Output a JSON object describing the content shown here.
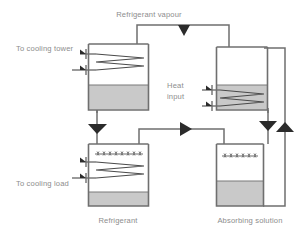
{
  "diagram": {
    "type": "schematic",
    "canvas": {
      "width": 303,
      "height": 238
    },
    "colors": {
      "background": "#ffffff",
      "outline": "#6f6f6f",
      "liquid": "#c9c9c9",
      "coil": "#4a4a4a",
      "arrow": "#2b2b2b",
      "label_text": "#8d8d8d"
    },
    "labels": {
      "refrigerant_vapour": "Refrigerant vapour",
      "to_cooling_tower": "To cooling tower",
      "heat_input_line1": "Heat",
      "heat_input_line2": "input",
      "to_cooling_load": "To cooling load",
      "refrigerant": "Refrigerant",
      "absorbing_solution": "Absorbing solution"
    },
    "vessels": [
      {
        "id": "condenser",
        "name": "condenser-vessel",
        "position": "top-left",
        "has_coil": true,
        "coil_in_liquid": false,
        "has_spray": false,
        "liquid_level": "lower-third"
      },
      {
        "id": "generator",
        "name": "generator-vessel",
        "position": "top-right",
        "has_coil": true,
        "coil_in_liquid": true,
        "has_spray": false,
        "liquid_level": "lower-half"
      },
      {
        "id": "evaporator",
        "name": "evaporator-vessel",
        "position": "bottom-left",
        "has_coil": true,
        "coil_in_liquid": false,
        "has_spray": true,
        "liquid_level": "thin-bottom"
      },
      {
        "id": "absorber",
        "name": "absorber-vessel",
        "position": "bottom-right",
        "has_coil": false,
        "coil_in_liquid": false,
        "has_spray": true,
        "liquid_level": "lower-half"
      }
    ],
    "flow_arrows": [
      {
        "name": "vapour-flow-arrow",
        "direction": "left",
        "on": "top-pipe"
      },
      {
        "name": "condensate-down-arrow",
        "direction": "down",
        "on": "left-vertical-pipe"
      },
      {
        "name": "solution-right-arrow",
        "direction": "right",
        "on": "middle-horizontal-pipe"
      },
      {
        "name": "strong-solution-down-arrow",
        "direction": "down",
        "on": "right-inner-pipe"
      },
      {
        "name": "weak-solution-up-arrow",
        "direction": "up",
        "on": "right-outer-pipe"
      },
      {
        "name": "cooling-tower-in-arrow",
        "direction": "right",
        "on": "condenser-coil-inlet"
      },
      {
        "name": "cooling-tower-out-arrow",
        "direction": "right",
        "on": "condenser-coil-outlet"
      },
      {
        "name": "heat-input-top-arrow",
        "direction": "right",
        "on": "generator-coil-inlet"
      },
      {
        "name": "heat-input-bottom-arrow",
        "direction": "right",
        "on": "generator-coil-outlet"
      },
      {
        "name": "cooling-load-in-arrow",
        "direction": "right",
        "on": "evaporator-coil-inlet"
      },
      {
        "name": "cooling-load-out-arrow",
        "direction": "right",
        "on": "evaporator-coil-outlet"
      }
    ]
  }
}
